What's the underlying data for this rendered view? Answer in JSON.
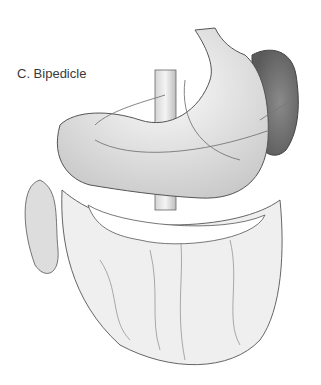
{
  "figure": {
    "label": "C. Bipedicle"
  }
}
